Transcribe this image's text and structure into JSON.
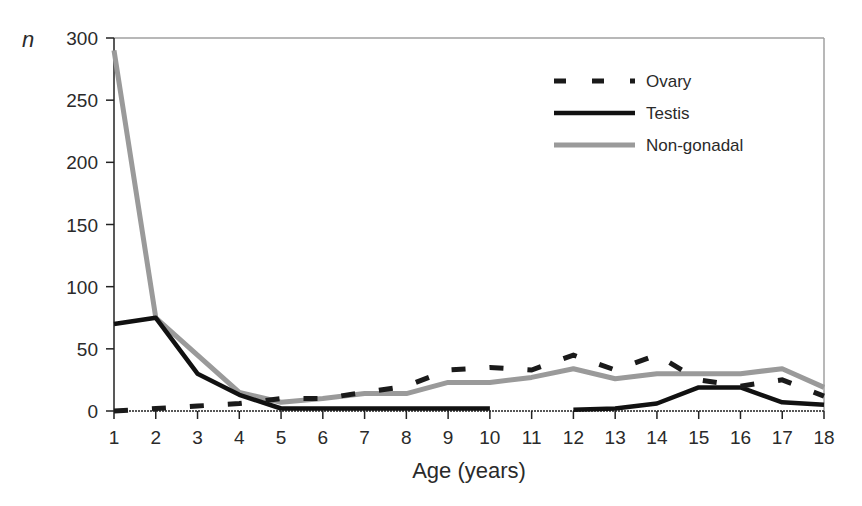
{
  "chart_data": {
    "type": "line",
    "title": "",
    "xlabel": "Age (years)",
    "ylabel": "n",
    "x": [
      1,
      2,
      3,
      4,
      5,
      6,
      7,
      8,
      9,
      10,
      11,
      12,
      13,
      14,
      15,
      16,
      17,
      18
    ],
    "xlim": [
      1,
      18
    ],
    "ylim": [
      0,
      300
    ],
    "yticks": [
      0,
      50,
      100,
      150,
      200,
      250,
      300
    ],
    "grid": false,
    "legend_position": "upper right",
    "series": [
      {
        "name": "Ovary",
        "style": "dashed",
        "color": "#1a1a1a",
        "values": [
          0,
          2,
          4,
          6,
          10,
          10,
          15,
          20,
          33,
          35,
          33,
          45,
          33,
          45,
          25,
          20,
          25,
          12
        ]
      },
      {
        "name": "Testis",
        "style": "solid",
        "color": "#111111",
        "values": [
          70,
          75,
          30,
          13,
          2,
          2,
          2,
          2,
          2,
          2,
          null,
          1,
          2,
          6,
          19,
          19,
          7,
          5
        ]
      },
      {
        "name": "Non-gonadal",
        "style": "solid",
        "color": "#9a9a9a",
        "values": [
          290,
          75,
          45,
          15,
          7,
          10,
          14,
          14,
          23,
          23,
          27,
          34,
          26,
          30,
          30,
          30,
          34,
          19
        ]
      }
    ]
  }
}
